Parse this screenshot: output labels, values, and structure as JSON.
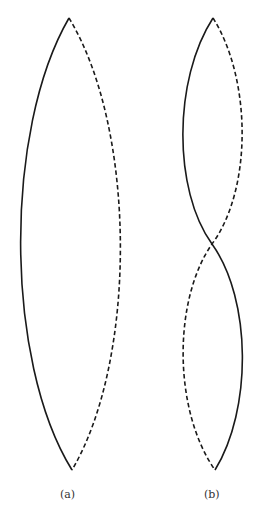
{
  "figure": {
    "panels": [
      {
        "id": "a",
        "caption": "(a)",
        "description": "Fundamental standing-wave mode: single loop between two fixed endpoints",
        "endpoints": {
          "top": [
            69,
            18
          ],
          "bottom": [
            72,
            470
          ]
        },
        "curves": [
          {
            "style": "solid",
            "side": "left",
            "extreme_x": 18
          },
          {
            "style": "dashed",
            "side": "right",
            "extreme_x": 122
          }
        ],
        "nodes": 2,
        "antinodes": 1
      },
      {
        "id": "b",
        "caption": "(b)",
        "description": "Second harmonic standing-wave mode: two loops with central node",
        "endpoints": {
          "top": [
            213,
            18
          ],
          "bottom": [
            215,
            470
          ]
        },
        "node_center": [
          212,
          244
        ],
        "curves": [
          {
            "style": "solid",
            "shape": "S-curve, left on top half, right on bottom half"
          },
          {
            "style": "dashed",
            "shape": "S-curve, right on top half, left on bottom half"
          }
        ],
        "nodes": 3,
        "antinodes": 2
      }
    ],
    "line_color": "#1a1a1a",
    "background": "#ffffff"
  }
}
